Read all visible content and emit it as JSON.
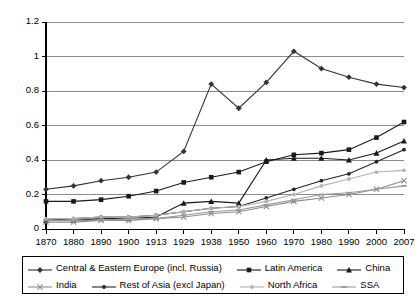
{
  "chart_data": {
    "type": "line",
    "title": "",
    "subtitle": "",
    "xlabel": "",
    "ylabel": "",
    "grid": true,
    "legend_position": "bottom",
    "x": [
      "1870",
      "1880",
      "1890",
      "1900",
      "1913",
      "1929",
      "1938",
      "1950",
      "1960",
      "1970",
      "1980",
      "1990",
      "2000",
      "2007"
    ],
    "x_tick_labels": [
      "1870",
      "1880",
      "1890",
      "1900",
      "1913",
      "1929",
      "1938",
      "1950",
      "1960",
      "1970",
      "1980",
      "1990",
      "2000",
      "2007"
    ],
    "y_tick_labels": [
      "0",
      "0.2",
      "0.4",
      "0.6",
      "0.8",
      "1",
      "1.2"
    ],
    "y_ticks": [
      0,
      0.2,
      0.4,
      0.6,
      0.8,
      1,
      1.2
    ],
    "ylim": [
      0,
      1.2
    ],
    "series": [
      {
        "name": "Central & Eastern Europe (incl. Russia)",
        "marker": "diamond",
        "color": "#333333",
        "values": [
          0.23,
          0.25,
          0.28,
          0.3,
          0.33,
          0.45,
          0.84,
          0.7,
          0.85,
          1.03,
          0.93,
          0.88,
          0.84,
          0.82
        ]
      },
      {
        "name": "Latin America",
        "marker": "square",
        "color": "#1a1a1a",
        "values": [
          0.16,
          0.16,
          0.17,
          0.19,
          0.22,
          0.27,
          0.3,
          0.33,
          0.39,
          0.43,
          0.44,
          0.46,
          0.53,
          0.62
        ]
      },
      {
        "name": "China",
        "marker": "triangle",
        "color": "#1a1a1a",
        "values": [
          0.05,
          0.05,
          0.06,
          0.06,
          0.07,
          0.15,
          0.16,
          0.15,
          0.4,
          0.41,
          0.41,
          0.4,
          0.44,
          0.51
        ]
      },
      {
        "name": "India",
        "marker": "cross",
        "color": "#8c8c8c",
        "values": [
          0.04,
          0.04,
          0.05,
          0.05,
          0.06,
          0.07,
          0.09,
          0.1,
          0.13,
          0.16,
          0.18,
          0.2,
          0.23,
          0.28
        ]
      },
      {
        "name": "Rest of Asia (excl Japan)",
        "marker": "dot",
        "color": "#262626",
        "values": [
          0.05,
          0.06,
          0.07,
          0.07,
          0.08,
          0.1,
          0.12,
          0.13,
          0.18,
          0.23,
          0.28,
          0.32,
          0.39,
          0.46
        ]
      },
      {
        "name": "North Africa",
        "marker": "dot",
        "color": "#b3b3b3",
        "values": [
          0.06,
          0.06,
          0.07,
          0.07,
          0.08,
          0.1,
          0.12,
          0.13,
          0.16,
          0.2,
          0.25,
          0.29,
          0.33,
          0.34
        ]
      },
      {
        "name": "SSA",
        "marker": "dash",
        "color": "#999999",
        "values": [
          0.05,
          0.05,
          0.05,
          0.06,
          0.06,
          0.08,
          0.1,
          0.11,
          0.14,
          0.17,
          0.2,
          0.21,
          0.23,
          0.25
        ]
      }
    ]
  },
  "legend": {
    "rows": [
      [
        {
          "label": "Central & Eastern Europe (incl. Russia)",
          "series_index": 0
        },
        {
          "label": "Latin America",
          "series_index": 1
        },
        {
          "label": "China",
          "series_index": 2
        }
      ],
      [
        {
          "label": "India",
          "series_index": 3
        },
        {
          "label": "Rest of Asia (excl Japan)",
          "series_index": 4
        },
        {
          "label": "North Africa",
          "series_index": 5
        },
        {
          "label": "SSA",
          "series_index": 6
        }
      ]
    ]
  },
  "axes": {
    "frame_color": "#000000",
    "grid_color": "#808080"
  }
}
